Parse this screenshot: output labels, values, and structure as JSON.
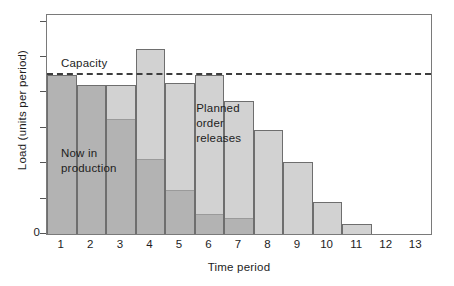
{
  "chart_data": {
    "type": "bar",
    "title": "",
    "xlabel": "Time period",
    "ylabel": "Load (units per period)",
    "categories": [
      "1",
      "2",
      "3",
      "4",
      "5",
      "6",
      "7",
      "8",
      "9",
      "10",
      "11",
      "12",
      "13"
    ],
    "xtick_labels": [
      "1",
      "2",
      "3",
      "4",
      "5",
      "6",
      "7",
      "8",
      "9",
      "10",
      "11",
      "12",
      "13"
    ],
    "ytick_labels": [
      "0",
      "",
      "",
      "",
      "",
      "",
      ""
    ],
    "ylim": [
      0,
      110
    ],
    "xlim": [
      0.5,
      13.5
    ],
    "grid": false,
    "legend_position": "in-plot annotations",
    "stacked": true,
    "series": [
      {
        "name": "Now in production",
        "color": "#b3b3b3",
        "values": [
          80,
          75,
          58,
          38,
          22,
          10,
          8,
          0,
          0,
          0,
          0,
          0,
          0
        ]
      },
      {
        "name": "Planned order releases",
        "color": "#d2d2d2",
        "values": [
          0,
          0,
          17,
          55,
          54,
          70,
          59,
          52,
          36,
          16,
          5,
          0,
          0
        ]
      }
    ],
    "totals": [
      80,
      75,
      75,
      93,
      76,
      80,
      67,
      52,
      36,
      16,
      5,
      0,
      0
    ],
    "capacity": {
      "label": "Capacity",
      "value": 80,
      "line_style": "dashed",
      "color": "#3d3d3d"
    },
    "annotations": [
      {
        "text": "Now in\nproduction",
        "near_periods": [
          1,
          3
        ]
      },
      {
        "text": "Planned\norder\nreleases",
        "near_periods": [
          6,
          7
        ]
      }
    ]
  },
  "axes": {
    "y_title": "Load (units per period)",
    "y_zero": "0",
    "x_title": "Time period"
  },
  "labels": {
    "capacity": "Capacity",
    "now_in_production": "Now in\nproduction",
    "planned_order_releases": "Planned\norder\nreleases"
  },
  "colors": {
    "production_fill": "#b3b3b3",
    "planned_fill": "#d2d2d2",
    "bar_outline": "#6e6e6e",
    "frame": "#7a7a7a",
    "capacity_line": "#3d3d3d",
    "text": "#1d1d1d",
    "background": "#ffffff"
  }
}
